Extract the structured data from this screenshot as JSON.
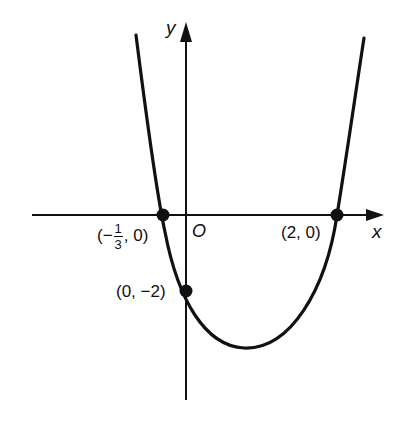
{
  "diagram": {
    "type": "parabola graph",
    "curve_equation": "y = 3x^2 - 5x - 2",
    "axes": {
      "x_label": "x",
      "y_label": "y",
      "origin_label": "O"
    },
    "points": [
      {
        "id": "left-root",
        "label": "(−1/3, 0)",
        "label_prefix": "(−",
        "num": "1",
        "den": "3",
        "label_suffix": ", 0)"
      },
      {
        "id": "right-root",
        "label": "(2, 0)"
      },
      {
        "id": "y-intercept",
        "label": "(0, −2)"
      }
    ],
    "colors": {
      "ink": "#111111",
      "background": "#ffffff"
    }
  }
}
